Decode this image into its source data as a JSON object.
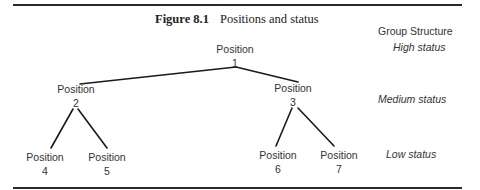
{
  "figure": {
    "number": "Figure 8.1",
    "title": "Positions and status"
  },
  "legend": {
    "heading": "Group Structure",
    "levels": [
      "High status",
      "Medium status",
      "Low status"
    ]
  },
  "nodes": [
    {
      "label": "Position",
      "id": "1"
    },
    {
      "label": "Position",
      "id": "2"
    },
    {
      "label": "Position",
      "id": "3"
    },
    {
      "label": "Position",
      "id": "4"
    },
    {
      "label": "Position",
      "id": "5"
    },
    {
      "label": "Position",
      "id": "6"
    },
    {
      "label": "Position",
      "id": "7"
    }
  ],
  "edges": [
    [
      "1",
      "2"
    ],
    [
      "1",
      "3"
    ],
    [
      "2",
      "4"
    ],
    [
      "2",
      "5"
    ],
    [
      "3",
      "6"
    ],
    [
      "3",
      "7"
    ]
  ]
}
